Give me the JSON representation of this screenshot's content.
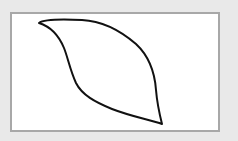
{
  "canvas": {
    "background": "#ffffff",
    "border_color": "#a8a8a8",
    "page_background": "#e9e9e9"
  },
  "drawing": {
    "shape": "leaf-outline",
    "stroke_color": "#111111",
    "stroke_width": 2,
    "path": "M39,23 C44,19 62,19 82,20 C104,21 122,32 136,44 C150,57 155,76 156,90 C157,102 159,112 162,124 C150,120 130,116 112,109 C95,102 82,95 76,83 C70,70 68,58 64,48 C59,36 52,27 39,23 Z"
  }
}
